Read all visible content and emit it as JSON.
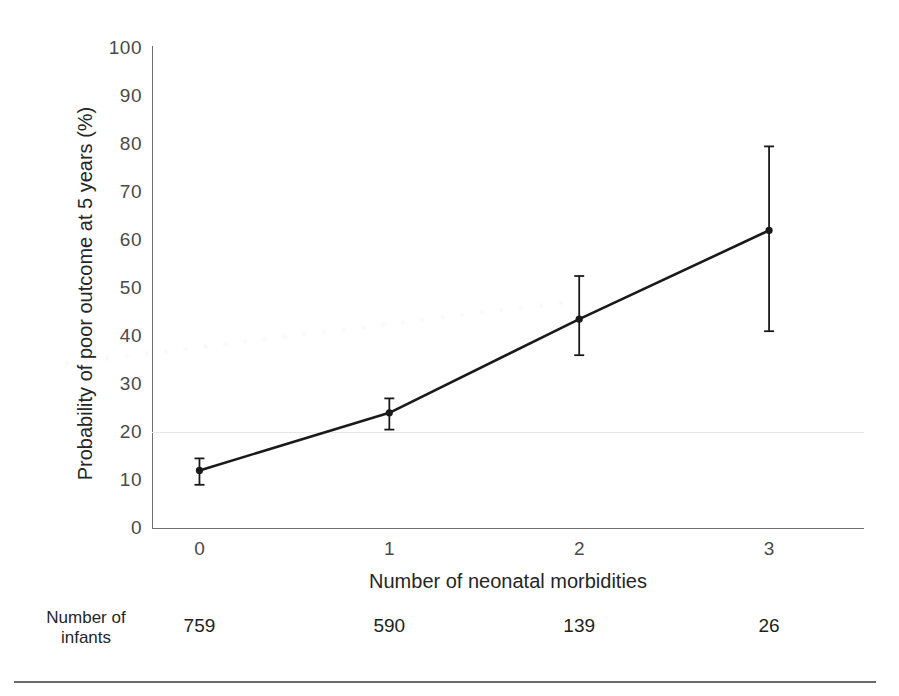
{
  "chart_data": {
    "type": "line",
    "title": "",
    "xlabel": "Number of neonatal morbidities",
    "ylabel": "Probability of poor outcome at 5 years (%)",
    "x": [
      0,
      1,
      2,
      3
    ],
    "categories": [
      "0",
      "1",
      "2",
      "3"
    ],
    "values": [
      12,
      24,
      43.5,
      62
    ],
    "error_low": [
      9,
      20.5,
      36,
      41
    ],
    "error_high": [
      14.5,
      27,
      52.5,
      79.5
    ],
    "xlim": [
      -0.25,
      3.5
    ],
    "ylim": [
      0,
      100
    ],
    "ytick_labels": [
      "100",
      "90",
      "80",
      "70",
      "60",
      "50",
      "40",
      "30",
      "20",
      "10",
      "0"
    ],
    "ytick_values": [
      100,
      90,
      80,
      70,
      60,
      50,
      40,
      30,
      20,
      10,
      0
    ],
    "xtick_labels": [
      "0",
      "1",
      "2",
      "3"
    ],
    "gridlines": [
      20
    ],
    "grid": "single-faint-horizontal-at-20",
    "legend": "none",
    "series_color": "#1a1a1a",
    "axis_color": "#6e6e6e",
    "grid_color": "#e6e6e6",
    "marker": "filled-circle",
    "error_bar_style": "capped-vertical"
  },
  "counts_table": {
    "row_label_line1": "Number of",
    "row_label_line2": "infants",
    "values": [
      "759",
      "590",
      "139",
      "26"
    ]
  },
  "watermark": {
    "text": "· · · · · · · · · · · · · · · · · · · · · · · · · ·"
  }
}
